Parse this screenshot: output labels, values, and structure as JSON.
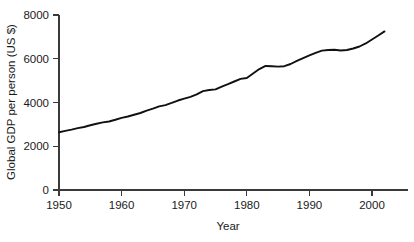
{
  "chart_data": {
    "type": "line",
    "title": "",
    "subtitle": "",
    "xlabel": "Year",
    "ylabel": "Global GDP per person (US $)",
    "xlim": [
      1950,
      2003
    ],
    "ylim": [
      0,
      8000
    ],
    "grid": false,
    "legend": null,
    "annotations": [],
    "x_ticks": [
      1950,
      1960,
      1970,
      1980,
      1990,
      2000
    ],
    "x_tick_labels": [
      "1950",
      "1960",
      "1970",
      "1980",
      "1990",
      "2000"
    ],
    "y_ticks": [
      0,
      2000,
      4000,
      6000,
      8000
    ],
    "y_tick_labels": [
      "0",
      "2000",
      "4000",
      "6000",
      "8000"
    ],
    "line_color": "#111111",
    "series": [
      {
        "name": "Global GDP per person (US $)",
        "x": [
          1950,
          1951,
          1952,
          1953,
          1954,
          1955,
          1956,
          1957,
          1958,
          1959,
          1960,
          1961,
          1962,
          1963,
          1964,
          1965,
          1966,
          1967,
          1968,
          1969,
          1970,
          1971,
          1972,
          1973,
          1974,
          1975,
          1976,
          1977,
          1978,
          1979,
          1980,
          1981,
          1982,
          1983,
          1984,
          1985,
          1986,
          1987,
          1988,
          1989,
          1990,
          1991,
          1992,
          1993,
          1994,
          1995,
          1996,
          1997,
          1998,
          1999,
          2000,
          2001,
          2002
        ],
        "values": [
          2640,
          2700,
          2760,
          2830,
          2880,
          2960,
          3030,
          3090,
          3130,
          3210,
          3300,
          3360,
          3440,
          3520,
          3630,
          3720,
          3820,
          3880,
          3980,
          4090,
          4180,
          4260,
          4370,
          4520,
          4570,
          4600,
          4730,
          4840,
          4960,
          5080,
          5120,
          5330,
          5530,
          5670,
          5660,
          5640,
          5660,
          5760,
          5900,
          6030,
          6150,
          6270,
          6370,
          6400,
          6410,
          6380,
          6400,
          6470,
          6560,
          6700,
          6880,
          7060,
          7250
        ]
      }
    ]
  },
  "axes": {
    "y_axis_title": "Global GDP per person (US $)",
    "x_axis_title": "Year"
  }
}
